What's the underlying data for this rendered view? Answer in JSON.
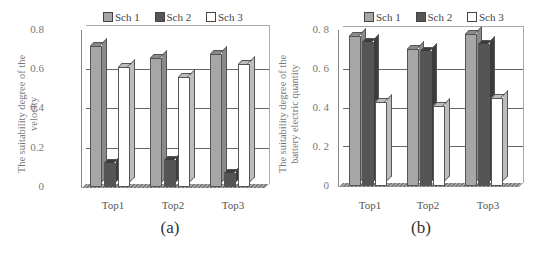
{
  "colors": {
    "sch1": "#a6a6a6",
    "sch1_side": "#8a8a8a",
    "sch2": "#555555",
    "sch2_side": "#3c3c3c",
    "sch3": "#ffffff",
    "sch3_side": "#bdbdbd"
  },
  "legend": [
    "Sch 1",
    "Sch 2",
    "Sch 3"
  ],
  "yticks": [
    "0",
    "0.2",
    "0.4",
    "0.6",
    "0.8"
  ],
  "yticks_b": [
    "0",
    "0. 2",
    "0. 4",
    "0. 6",
    "0. 8"
  ],
  "categories": [
    "Top1",
    "Top2",
    "Top3"
  ],
  "panels": [
    {
      "caption": "(a)",
      "ylabel_line1": "The suitability degree of the",
      "ylabel_line2": "velocity"
    },
    {
      "caption": "(b)",
      "ylabel_line1": "The suitability degree of the",
      "ylabel_line2": "battery electric quantity"
    }
  ],
  "chart_data": [
    {
      "type": "bar",
      "title": "(a)",
      "categories": [
        "Top1",
        "Top2",
        "Top3"
      ],
      "series": [
        {
          "name": "Sch 1",
          "values": [
            0.72,
            0.66,
            0.68
          ]
        },
        {
          "name": "Sch 2",
          "values": [
            0.12,
            0.14,
            0.07
          ]
        },
        {
          "name": "Sch 3",
          "values": [
            0.61,
            0.56,
            0.63
          ]
        }
      ],
      "xlabel": "",
      "ylabel": "The suitability degree of the velocity",
      "ylim": [
        0,
        0.8
      ],
      "yticks": [
        0,
        0.2,
        0.4,
        0.6,
        0.8
      ],
      "grid": true,
      "legend_position": "top",
      "style": "3d-clustered-column"
    },
    {
      "type": "bar",
      "title": "(b)",
      "categories": [
        "Top1",
        "Top2",
        "Top3"
      ],
      "series": [
        {
          "name": "Sch 1",
          "values": [
            0.77,
            0.7,
            0.78
          ]
        },
        {
          "name": "Sch 2",
          "values": [
            0.74,
            0.69,
            0.73
          ]
        },
        {
          "name": "Sch 3",
          "values": [
            0.43,
            0.41,
            0.45
          ]
        }
      ],
      "xlabel": "",
      "ylabel": "The suitability degree of the battery electric quantity",
      "ylim": [
        0,
        0.8
      ],
      "yticks": [
        0,
        0.2,
        0.4,
        0.6,
        0.8
      ],
      "grid": true,
      "legend_position": "top",
      "style": "3d-clustered-column"
    }
  ]
}
